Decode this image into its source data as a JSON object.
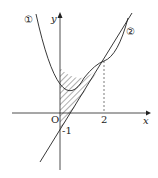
{
  "figure": {
    "curve1_label": "①",
    "curve2_label": "②",
    "x_axis_label": "x",
    "y_axis_label": "y",
    "origin_label": "O",
    "x_tick_label": "2",
    "y_intercept_label": "-1"
  },
  "colors": {
    "stroke": "#222222",
    "background": "#ffffff"
  }
}
